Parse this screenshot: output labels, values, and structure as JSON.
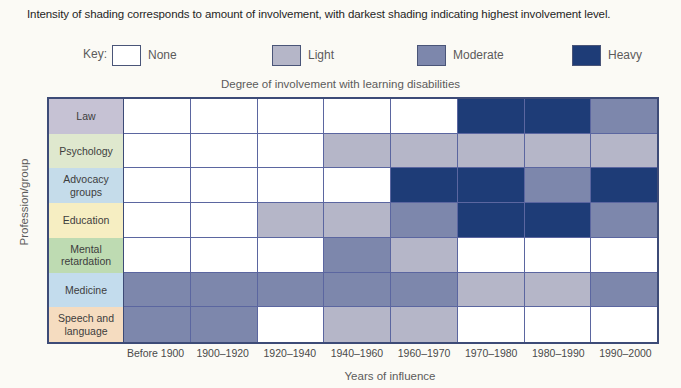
{
  "caption": "Intensity of shading corresponds to amount of involvement, with darkest shading indicating highest involvement level.",
  "legend": {
    "key_label": "Key:",
    "items": [
      {
        "label": "None",
        "color": "#ffffff",
        "left": 85,
        "name": "legend-none"
      },
      {
        "label": "Light",
        "color": "#b5b6c8",
        "left": 245,
        "name": "legend-light"
      },
      {
        "label": "Moderate",
        "color": "#7d87ac",
        "left": 390,
        "name": "legend-moderate"
      },
      {
        "label": "Heavy",
        "color": "#1e3c77",
        "left": 545,
        "name": "legend-heavy"
      }
    ]
  },
  "chart_title": "Degree of involvement with learning disabilities",
  "x_axis_title": "Years of influence",
  "y_axis_title": "Profession/group",
  "colors": {
    "none": "#ffffff",
    "light": "#b5b6c8",
    "moderate": "#7d87ac",
    "heavy": "#1e3c77",
    "frame": "#3d4b77",
    "gridline": "#5b66a0",
    "background": "#fbfaf5"
  },
  "chart_data": {
    "type": "heatmap",
    "title": "Degree of involvement with learning disabilities",
    "xlabel": "Years of influence",
    "ylabel": "Profession/group",
    "grid": true,
    "legend_position": "top",
    "value_scale": [
      "None",
      "Light",
      "Moderate",
      "Heavy"
    ],
    "categories": [
      "Before 1900",
      "1900–1920",
      "1920–1940",
      "1940–1960",
      "1960–1970",
      "1970–1980",
      "1980–1990",
      "1990–2000"
    ],
    "rows": [
      {
        "label": "Law",
        "label_color": "#c6c2d4",
        "values": [
          "None",
          "None",
          "None",
          "None",
          "None",
          "Heavy",
          "Heavy",
          "Moderate"
        ]
      },
      {
        "label": "Psychology",
        "label_color": "#dfe8ce",
        "values": [
          "None",
          "None",
          "None",
          "Light",
          "Light",
          "Light",
          "Light",
          "Light"
        ]
      },
      {
        "label": "Advocacy groups",
        "label_color": "#c5dcea",
        "values": [
          "None",
          "None",
          "None",
          "None",
          "Heavy",
          "Heavy",
          "Moderate",
          "Heavy"
        ]
      },
      {
        "label": "Education",
        "label_color": "#f6eec2",
        "values": [
          "None",
          "None",
          "Light",
          "Light",
          "Moderate",
          "Heavy",
          "Heavy",
          "Moderate"
        ]
      },
      {
        "label": "Mental retardation",
        "label_color": "#bedbb2",
        "values": [
          "None",
          "None",
          "None",
          "Moderate",
          "Light",
          "None",
          "None",
          "None"
        ]
      },
      {
        "label": "Medicine",
        "label_color": "#c3dced",
        "values": [
          "Moderate",
          "Moderate",
          "Moderate",
          "Moderate",
          "Moderate",
          "Light",
          "Light",
          "Moderate"
        ]
      },
      {
        "label": "Speech and language",
        "label_color": "#f5dcc0",
        "values": [
          "Moderate",
          "Moderate",
          "None",
          "Light",
          "Light",
          "None",
          "None",
          "None"
        ]
      }
    ]
  }
}
